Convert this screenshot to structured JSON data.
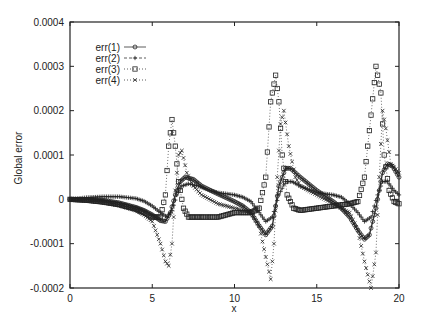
{
  "chart_data": {
    "type": "line",
    "title": "",
    "xlabel": "x",
    "ylabel": "Global error",
    "xlim": [
      0,
      20
    ],
    "ylim": [
      -0.0002,
      0.0004
    ],
    "xticks": [
      "0",
      "5",
      "10",
      "15",
      "20"
    ],
    "yticks": [
      "0.0004",
      "0.0003",
      "0.0002",
      "0.0001",
      "0",
      "-0.0001",
      "-0.0002"
    ],
    "grid": false,
    "legend_position": "upper-left-inside",
    "series": [
      {
        "name": "err(1)",
        "marker": "circle",
        "line": "solid",
        "x": [
          0,
          1,
          2,
          3,
          4,
          4.5,
          5,
          5.5,
          5.8,
          6.1,
          6.4,
          6.7,
          7.0,
          7.5,
          8,
          9,
          10,
          10.5,
          11,
          11.5,
          11.9,
          12.3,
          12.7,
          13.1,
          13.4,
          14,
          15,
          16,
          16.5,
          17,
          17.5,
          17.9,
          18.2,
          18.6,
          19.0,
          19.3,
          19.6,
          20
        ],
        "y": [
          0,
          0,
          -2e-06,
          -8e-06,
          -1.8e-05,
          -2.5e-05,
          -3.5e-05,
          -4.8e-05,
          -5e-05,
          -3e-05,
          1e-05,
          4e-05,
          5e-05,
          4.5e-05,
          3e-05,
          1.2e-05,
          -5e-06,
          -1.5e-05,
          -3e-05,
          -6e-05,
          -8e-05,
          -6e-05,
          3e-05,
          7e-05,
          7e-05,
          5e-05,
          2e-05,
          -5e-06,
          -2e-05,
          -4e-05,
          -7e-05,
          -9e-05,
          -8e-05,
          -2e-05,
          6e-05,
          8e-05,
          7.5e-05,
          5e-05
        ]
      },
      {
        "name": "err(2)",
        "marker": "plus",
        "line": "dashed",
        "x": [
          0,
          1,
          2,
          3,
          4,
          4.5,
          5,
          5.5,
          5.9,
          6.2,
          6.5,
          6.8,
          7.2,
          7.8,
          8.5,
          9,
          10,
          10.5,
          11,
          11.5,
          11.9,
          12.3,
          12.7,
          13.1,
          13.5,
          14,
          15,
          16,
          16.5,
          17,
          17.5,
          17.9,
          18.3,
          18.7,
          19.0,
          19.3,
          19.7,
          20
        ],
        "y": [
          0,
          4e-06,
          6e-06,
          6e-06,
          2e-06,
          -4e-06,
          -1.5e-05,
          -3e-05,
          -4e-05,
          -2.5e-05,
          1e-05,
          3e-05,
          3.5e-05,
          3e-05,
          2e-05,
          1.5e-05,
          1e-05,
          5e-06,
          -5e-06,
          -3e-05,
          -5e-05,
          -4e-05,
          1e-05,
          4e-05,
          4e-05,
          3e-05,
          1.5e-05,
          1e-05,
          5e-06,
          -1e-05,
          -3e-05,
          -5e-05,
          -4e-05,
          1e-05,
          4e-05,
          4e-05,
          2e-05,
          1e-05
        ]
      },
      {
        "name": "err(3)",
        "marker": "square",
        "line": "dotted",
        "x": [
          0,
          1,
          2,
          3,
          4,
          4.5,
          5,
          5.5,
          5.8,
          6.0,
          6.2,
          6.4,
          6.6,
          6.9,
          7.2,
          7.6,
          8,
          9,
          10,
          11,
          11.5,
          11.9,
          12.2,
          12.5,
          12.7,
          12.9,
          13.2,
          13.6,
          14,
          15,
          16,
          17,
          17.5,
          17.9,
          18.3,
          18.6,
          18.9,
          19.1,
          19.4,
          19.7,
          20
        ],
        "y": [
          0,
          -2e-06,
          -6e-06,
          -1.2e-05,
          -2.2e-05,
          -3e-05,
          -4e-05,
          -4e-05,
          1e-05,
          0.00012,
          0.00018,
          0.00012,
          4e-05,
          -2e-05,
          -4e-05,
          -4e-05,
          -4e-05,
          -4e-05,
          -3e-05,
          -3e-05,
          -2e-05,
          5e-05,
          0.00022,
          0.00028,
          0.00022,
          0.0001,
          1e-05,
          -2e-05,
          -2.5e-05,
          -2e-05,
          -1.5e-05,
          -1e-05,
          -5e-06,
          5e-05,
          0.00019,
          0.0003,
          0.00024,
          0.0001,
          2e-05,
          -5e-06,
          -1e-05
        ]
      },
      {
        "name": "err(4)",
        "marker": "cross",
        "line": "dotted",
        "x": [
          0,
          1,
          2,
          3,
          4,
          4.5,
          5,
          5.5,
          5.8,
          6.0,
          6.2,
          6.4,
          6.6,
          6.8,
          7.1,
          7.5,
          8,
          9,
          10,
          11,
          11.5,
          11.9,
          12.2,
          12.4,
          12.6,
          12.8,
          13.0,
          13.3,
          13.7,
          14,
          15,
          16,
          17,
          17.5,
          17.9,
          18.3,
          18.6,
          18.8,
          19.0,
          19.2,
          19.5,
          20
        ],
        "y": [
          0,
          -2e-06,
          -6e-06,
          -1.4e-05,
          -2.5e-05,
          -3.5e-05,
          -5e-05,
          -0.0001,
          -0.00014,
          -0.00015,
          -0.0001,
          2e-05,
          0.0001,
          0.00011,
          6e-05,
          3e-05,
          1e-05,
          -1e-05,
          -2e-05,
          -3e-05,
          -6e-05,
          -0.00013,
          -0.00018,
          -0.0001,
          5e-05,
          0.00017,
          0.0002,
          0.00012,
          5e-05,
          3e-05,
          1e-05,
          -1e-05,
          -3e-05,
          -7e-05,
          -0.00014,
          -0.0002,
          -0.00012,
          5e-05,
          0.0002,
          0.00016,
          8e-05,
          6e-05
        ]
      }
    ]
  },
  "legend": {
    "items": [
      "err(1)",
      "err(2)",
      "err(3)",
      "err(4)"
    ]
  }
}
